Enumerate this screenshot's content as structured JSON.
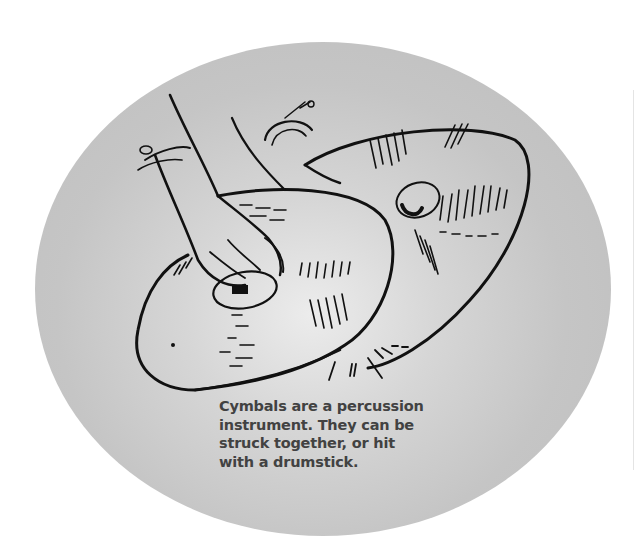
{
  "figure": {
    "subject": "cymbals",
    "illustration_icon": "cymbals-hand-drawing",
    "background_color": "#c4c4c4",
    "caption_color": "#424242",
    "caption_lines": [
      "Cymbals are a percussion",
      "instrument. They can be",
      "struck together, or hit",
      "with a drumstick."
    ]
  }
}
